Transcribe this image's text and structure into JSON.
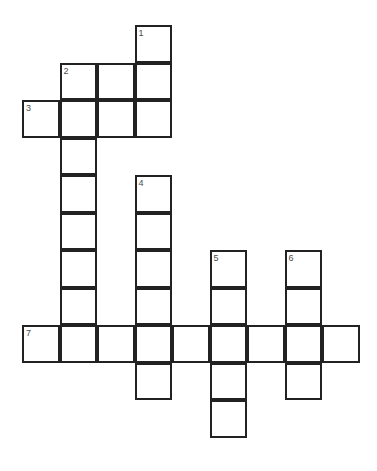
{
  "puzzle": {
    "title": "Crossword Grid",
    "type": "crossword-grid",
    "background_color": "#ffffff",
    "cell_border_color": "#222222",
    "cell_fill_color": "#ffffff",
    "number_color": "#4a4a4a",
    "cell_size": 37.5,
    "border_width": 2,
    "origin_x": 22,
    "origin_y": 25,
    "columns": 9,
    "rows": 11
  },
  "numbers": [
    {
      "label": "1",
      "col": 3,
      "row": 0
    },
    {
      "label": "2",
      "col": 1,
      "row": 1
    },
    {
      "label": "3",
      "col": 0,
      "row": 2
    },
    {
      "label": "4",
      "col": 3,
      "row": 4
    },
    {
      "label": "5",
      "col": 5,
      "row": 6
    },
    {
      "label": "6",
      "col": 7,
      "row": 6
    },
    {
      "label": "7",
      "col": 0,
      "row": 8
    }
  ],
  "entries": [
    {
      "number": "1",
      "direction": "down",
      "col": 3,
      "row": 0,
      "length": 3
    },
    {
      "number": "2",
      "direction": "down",
      "col": 1,
      "row": 1,
      "length": 8
    },
    {
      "number": "3",
      "direction": "across",
      "col": 0,
      "row": 2,
      "length": 4
    },
    {
      "number": "4",
      "direction": "down",
      "col": 3,
      "row": 4,
      "length": 6
    },
    {
      "number": "5",
      "direction": "down",
      "col": 5,
      "row": 6,
      "length": 5
    },
    {
      "number": "6",
      "direction": "down",
      "col": 7,
      "row": 6,
      "length": 4
    },
    {
      "number": "7",
      "direction": "across",
      "col": 0,
      "row": 8,
      "length": 9
    }
  ],
  "cells": [
    {
      "col": 3,
      "row": 0
    },
    {
      "col": 3,
      "row": 1
    },
    {
      "col": 1,
      "row": 1
    },
    {
      "col": 2,
      "row": 1
    },
    {
      "col": 0,
      "row": 2
    },
    {
      "col": 1,
      "row": 2
    },
    {
      "col": 2,
      "row": 2
    },
    {
      "col": 3,
      "row": 2
    },
    {
      "col": 1,
      "row": 3
    },
    {
      "col": 1,
      "row": 4
    },
    {
      "col": 3,
      "row": 4
    },
    {
      "col": 1,
      "row": 5
    },
    {
      "col": 3,
      "row": 5
    },
    {
      "col": 1,
      "row": 6
    },
    {
      "col": 3,
      "row": 6
    },
    {
      "col": 5,
      "row": 6
    },
    {
      "col": 7,
      "row": 6
    },
    {
      "col": 1,
      "row": 7
    },
    {
      "col": 3,
      "row": 7
    },
    {
      "col": 5,
      "row": 7
    },
    {
      "col": 7,
      "row": 7
    },
    {
      "col": 0,
      "row": 8
    },
    {
      "col": 1,
      "row": 8
    },
    {
      "col": 2,
      "row": 8
    },
    {
      "col": 3,
      "row": 8
    },
    {
      "col": 4,
      "row": 8
    },
    {
      "col": 5,
      "row": 8
    },
    {
      "col": 6,
      "row": 8
    },
    {
      "col": 7,
      "row": 8
    },
    {
      "col": 8,
      "row": 8
    },
    {
      "col": 3,
      "row": 9
    },
    {
      "col": 5,
      "row": 9
    },
    {
      "col": 7,
      "row": 9
    },
    {
      "col": 5,
      "row": 10
    }
  ]
}
